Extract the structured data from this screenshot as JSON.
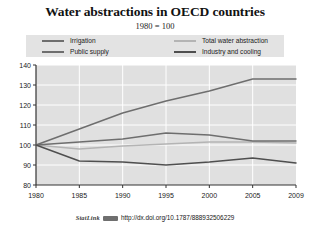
{
  "title": "Water abstractions in OECD countries",
  "subtitle": "1980 = 100",
  "legend": {
    "items": [
      {
        "label": "Irrigation",
        "color": "#6e6e6e"
      },
      {
        "label": "Public supply",
        "color": "#6e6e6e"
      },
      {
        "label": "Total water abstraction",
        "color": "#b4b4b4"
      },
      {
        "label": "Industry and cooling",
        "color": "#4f4f4f"
      }
    ]
  },
  "source": {
    "statlink_label": "StatLink",
    "icon": "statlink-badge-icon",
    "url": "http://dx.doi.org/10.1787/888932506229"
  },
  "chart_data": {
    "type": "line",
    "title": "Water abstractions in OECD countries",
    "subtitle": "1980 = 100",
    "xlabel": "",
    "ylabel": "",
    "x": [
      1980,
      1985,
      1990,
      1995,
      2000,
      2005,
      2009
    ],
    "xtick_labels": [
      "1980",
      "1985",
      "1990",
      "1995",
      "2000",
      "2005",
      "2009"
    ],
    "ytick_labels": [
      "80",
      "90",
      "100",
      "110",
      "120",
      "130",
      "140"
    ],
    "yticks": [
      80,
      90,
      100,
      110,
      120,
      130,
      140
    ],
    "ylim": [
      80,
      140
    ],
    "xlim": [
      1980,
      2009
    ],
    "grid": true,
    "legend_position": "top",
    "series": [
      {
        "name": "Irrigation",
        "color": "#6e6e6e",
        "values": [
          100,
          108,
          116,
          122,
          127,
          133,
          133
        ]
      },
      {
        "name": "Public supply",
        "color": "#6e6e6e",
        "values": [
          100,
          101.5,
          103,
          106,
          105,
          102,
          102
        ]
      },
      {
        "name": "Total water abstraction",
        "color": "#b4b4b4",
        "values": [
          100,
          98,
          99.5,
          100.5,
          101.5,
          101.5,
          101
        ]
      },
      {
        "name": "Industry and cooling",
        "color": "#4f4f4f",
        "values": [
          100,
          92,
          91.5,
          90,
          91.5,
          93.5,
          91
        ]
      }
    ]
  }
}
